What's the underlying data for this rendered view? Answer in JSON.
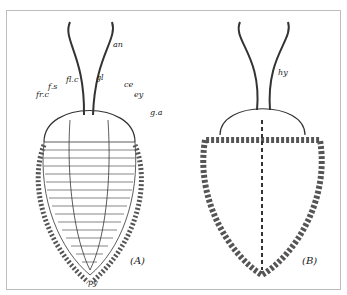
{
  "figure": {
    "panels": [
      {
        "id": "A",
        "caption": "(A)",
        "view": "dorsal",
        "labels": {
          "an": "an",
          "fs": "f.s",
          "flc": "fl.c",
          "gl": "gl",
          "ce": "ce",
          "frc": "fr.c",
          "ey": "ey",
          "ga": "g.a",
          "py": "py"
        }
      },
      {
        "id": "B",
        "caption": "(B)",
        "view": "ventral",
        "labels": {
          "hy": "hy"
        }
      }
    ]
  }
}
